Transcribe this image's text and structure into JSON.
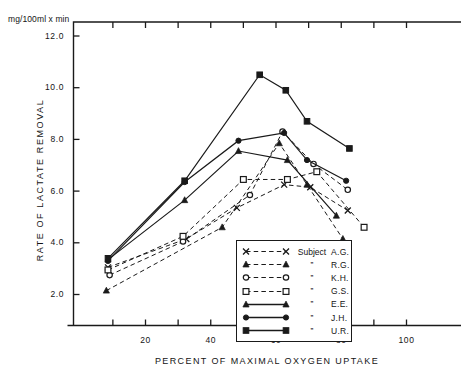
{
  "chart_data": {
    "type": "line",
    "title": "",
    "unit_label": "mg/100ml x min",
    "ylabel": "RATE  OF  LACTATE  REMOVAL",
    "xlabel": "PERCENT OF MAXIMAL OXYGEN UPTAKE",
    "xlim": [
      0,
      105
    ],
    "ylim": [
      1.0,
      12.8
    ],
    "xticks": [
      20,
      40,
      60,
      80,
      100
    ],
    "xticks_minor": [
      10,
      30,
      50,
      70,
      90
    ],
    "yticks": [
      2.0,
      4.0,
      6.0,
      8.0,
      10.0,
      12.0
    ],
    "ytick_labels": [
      "2.0",
      "4.0",
      "6.0",
      "8.0",
      "10.0",
      "12.0"
    ],
    "xtick_labels": [
      "20",
      "40",
      "60",
      "80",
      "100"
    ],
    "grid": false,
    "legend_position": "inside-bottom-center",
    "legend_title": "Subject",
    "series": [
      {
        "name": "A.G.",
        "legend_label": "Subject",
        "subject": "A.G.",
        "marker": "x",
        "dash": true,
        "x": [
          8.5,
          32.5,
          48.0,
          62.5,
          70.5,
          82.0
        ],
        "y": [
          3.05,
          4.15,
          5.35,
          6.25,
          6.15,
          5.25
        ]
      },
      {
        "name": "R.G.",
        "legend_label": "”",
        "subject": "R.G.",
        "marker": "triangle-filled",
        "dash": true,
        "x": [
          8.0,
          43.5,
          61.0,
          69.5,
          80.5
        ],
        "y": [
          2.15,
          4.6,
          7.85,
          6.25,
          4.15
        ]
      },
      {
        "name": "K.H.",
        "legend_label": "”",
        "subject": "K.H.",
        "marker": "circle-open",
        "dash": true,
        "x": [
          9.0,
          31.5,
          52.0,
          62.0,
          71.5,
          82.0
        ],
        "y": [
          2.75,
          4.05,
          5.85,
          8.3,
          7.05,
          6.05
        ]
      },
      {
        "name": "G.S.",
        "legend_label": "”",
        "subject": "G.S.",
        "marker": "square-open",
        "dash": true,
        "x": [
          8.5,
          31.5,
          50.0,
          63.5,
          72.5,
          87.0
        ],
        "y": [
          2.95,
          4.25,
          6.45,
          6.45,
          6.75,
          4.6
        ]
      },
      {
        "name": "E.E.",
        "legend_label": "”",
        "subject": "E.E.",
        "marker": "triangle-filled",
        "dash": false,
        "x": [
          8.5,
          32.0,
          48.5,
          63.5,
          78.5
        ],
        "y": [
          3.35,
          5.65,
          7.55,
          7.2,
          5.05
        ]
      },
      {
        "name": "J.H.",
        "legend_label": "”",
        "subject": "J.H.",
        "marker": "circle-filled",
        "dash": false,
        "x": [
          8.5,
          32.0,
          48.5,
          62.5,
          69.5,
          81.5
        ],
        "y": [
          3.3,
          6.35,
          7.95,
          8.25,
          7.2,
          6.4
        ]
      },
      {
        "name": "U.R.",
        "legend_label": "”",
        "subject": "U.R.",
        "marker": "square-filled",
        "dash": false,
        "x": [
          8.5,
          32.0,
          55.0,
          63.0,
          69.5,
          82.5
        ],
        "y": [
          3.4,
          6.4,
          10.5,
          9.9,
          8.7,
          7.65
        ]
      }
    ],
    "colors": {
      "line": "#1a1a1a",
      "axis": "#1a1a1a",
      "background": "#ffffff"
    }
  },
  "legend": {
    "title": "Subject",
    "rows": [
      {
        "sample": "x-dashed",
        "mid": "Subject",
        "name": "A.G."
      },
      {
        "sample": "triangle-filled-dashed",
        "mid": "”",
        "name": "R.G."
      },
      {
        "sample": "circle-open-dashed",
        "mid": "”",
        "name": "K.H."
      },
      {
        "sample": "square-open-dashed",
        "mid": "”",
        "name": "G.S."
      },
      {
        "sample": "triangle-filled-solid",
        "mid": "”",
        "name": "E.E."
      },
      {
        "sample": "circle-filled-solid",
        "mid": "”",
        "name": "J.H."
      },
      {
        "sample": "square-filled-solid",
        "mid": "”",
        "name": "U.R."
      }
    ]
  }
}
